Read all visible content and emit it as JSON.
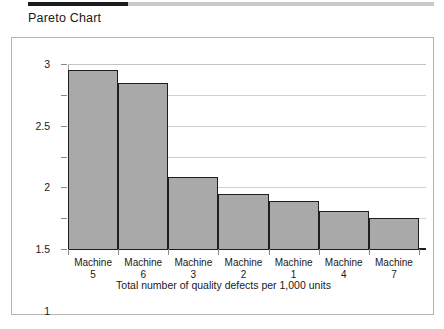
{
  "header": {
    "title": "Pareto Chart"
  },
  "chart_data": {
    "type": "bar",
    "title": "Pareto Chart",
    "xlabel": "Total number of quality defects per 1,000 units",
    "ylabel": "",
    "categories": [
      "Machine 5",
      "Machine 6",
      "Machine 3",
      "Machine 2",
      "Machine 1",
      "Machine 4",
      "Machine 7"
    ],
    "category_lines": [
      [
        "Machine",
        "5"
      ],
      [
        "Machine",
        "6"
      ],
      [
        "Machine",
        "3"
      ],
      [
        "Machine",
        "2"
      ],
      [
        "Machine",
        "1"
      ],
      [
        "Machine",
        "4"
      ],
      [
        "Machine",
        "7"
      ]
    ],
    "values": [
      2.9,
      2.7,
      1.17,
      0.9,
      0.78,
      0.62,
      0.5
    ],
    "ylim": [
      0,
      3
    ],
    "ytick_labels": [
      "0",
      "0.5",
      "1",
      "1.5",
      "2",
      "2.5",
      "3"
    ],
    "ytick_values": [
      0,
      0.5,
      1,
      1.5,
      2,
      2.5,
      3
    ],
    "grid": true,
    "legend": "none",
    "bar_gap": 0,
    "colors": {
      "bar_fill": "#a9a9a9",
      "bar_edge": "#1e1e1e",
      "gridline": "#d0d0d0",
      "axis": "#1e1e1e",
      "panel_border": "#b4b4b4",
      "accent_rule": "#1c1c1c",
      "text": "#1a1a1a"
    }
  }
}
